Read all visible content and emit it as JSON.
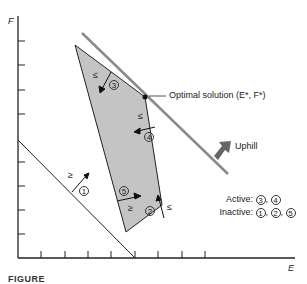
{
  "diagram": {
    "axes": {
      "x_label": "E",
      "y_label": "F"
    },
    "colors": {
      "feasible_region": "#c4c4c4",
      "objective_line": "#8a8a8a",
      "uphill_arrow": "#666666",
      "lines": "#222222"
    },
    "annotations": {
      "optimal": "Optimal solution (E*, F*)",
      "uphill": "Uphill",
      "active_label": "Active:",
      "inactive_label": "Inactive:",
      "separator": ","
    },
    "constraints": [
      {
        "id": "1",
        "sign": "≥"
      },
      {
        "id": "2",
        "sign": "≤"
      },
      {
        "id": "3",
        "sign": "≤"
      },
      {
        "id": "4",
        "sign": "≤"
      },
      {
        "id": "5",
        "sign": "≥"
      }
    ],
    "active": [
      "3",
      "4"
    ],
    "inactive": [
      "1",
      "2",
      "5"
    ],
    "caption": "FIGURE"
  }
}
